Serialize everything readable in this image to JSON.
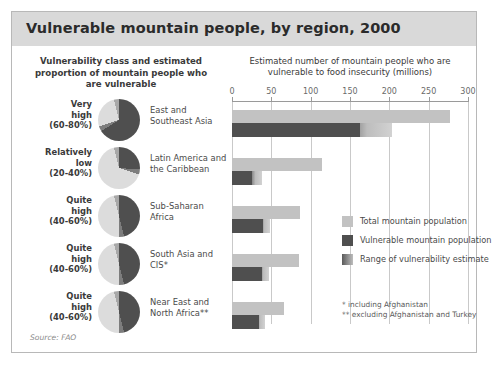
{
  "figure": {
    "title": "Vulnerable mountain people, by region, 2000",
    "source": "Source: FAO",
    "left_header": "Vulnerability class and estimated proportion of mountain people who are vulnerable",
    "chart_header": "Estimated number of mountain people who are vulnerable to food insecurity (millions)",
    "footnote1": "* including Afghanistan",
    "footnote2": "** excluding Afghanistan and Turkey"
  },
  "legend": {
    "items": [
      {
        "label": "Total mountain population",
        "color": "#c2c2c2"
      },
      {
        "label": "Vulnerable mountain population",
        "color": "#4f4f4f"
      },
      {
        "label": "Range of vulnerability estimate",
        "color": "#8a8a8a"
      }
    ]
  },
  "rows": [
    {
      "vclass_line1": "Very",
      "vclass_line2": "high",
      "vclass_range": "(60-80%)",
      "region": "East and Southeast Asia",
      "pie_vulnerable_pct": 70
    },
    {
      "vclass_line1": "Relatively",
      "vclass_line2": "low",
      "vclass_range": "(20-40%)",
      "region": "Latin America and the Caribbean",
      "pie_vulnerable_pct": 30
    },
    {
      "vclass_line1": "Quite",
      "vclass_line2": "high",
      "vclass_range": "(40-60%)",
      "region": "Sub-Saharan Africa",
      "pie_vulnerable_pct": 50
    },
    {
      "vclass_line1": "Quite",
      "vclass_line2": "high",
      "vclass_range": "(40-60%)",
      "region": "South Asia and CIS*",
      "pie_vulnerable_pct": 50
    },
    {
      "vclass_line1": "Quite",
      "vclass_line2": "high",
      "vclass_range": "(40-60%)",
      "region": "Near East and North Africa**",
      "pie_vulnerable_pct": 50
    }
  ],
  "chart_data": {
    "type": "bar",
    "orientation": "horizontal",
    "title": "Estimated number of mountain people who are vulnerable to food insecurity (millions)",
    "xlabel": "millions",
    "ylabel": "",
    "xlim": [
      0,
      300
    ],
    "xticks": [
      0,
      50,
      100,
      150,
      200,
      250,
      300
    ],
    "grid": true,
    "legend_position": "inside-right",
    "categories": [
      "East and Southeast Asia",
      "Latin America and the Caribbean",
      "Sub-Saharan Africa",
      "South Asia and CIS*",
      "Near East and North Africa**"
    ],
    "series": [
      {
        "name": "Total mountain population",
        "values": [
          277,
          115,
          87,
          85,
          66
        ]
      },
      {
        "name": "Vulnerable mountain population",
        "values": [
          163,
          25,
          40,
          38,
          34
        ]
      }
    ],
    "range_of_vulnerability_estimate": [
      {
        "category": "East and Southeast Asia",
        "low": 163,
        "high": 204
      },
      {
        "category": "Latin America and the Caribbean",
        "low": 25,
        "high": 38
      },
      {
        "category": "Sub-Saharan Africa",
        "low": 40,
        "high": 48
      },
      {
        "category": "South Asia and CIS*",
        "low": 38,
        "high": 47
      },
      {
        "category": "Near East and North Africa**",
        "low": 34,
        "high": 42
      }
    ]
  }
}
